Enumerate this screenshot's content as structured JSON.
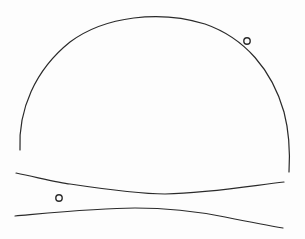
{
  "canvas": {
    "width": 305,
    "height": 239,
    "background": "#fdfdfd",
    "stroke_color": "#2a2a2a"
  },
  "drawing": {
    "dome_arc": {
      "d": "M 20 150 C 18 110, 35 70, 70 42 C 105 16, 160 10, 205 24 C 245 38, 272 70, 284 112 C 290 135, 290 155, 289 172",
      "stroke_width": 1.2
    },
    "upper_band_line": {
      "d": "M 16 173 C 40 178, 60 183, 70 184 C 110 190, 140 194, 165 194 C 210 193, 250 186, 284 182",
      "stroke_width": 1.2
    },
    "lower_band_line": {
      "d": "M 15 216 C 60 212, 100 208, 135 208 C 170 208, 200 212, 225 217 C 245 221, 265 225, 283 228",
      "stroke_width": 1.2
    },
    "small_circles": [
      {
        "name": "dome-circle",
        "cx": 247,
        "cy": 41,
        "r": 3.2
      },
      {
        "name": "band-circle",
        "cx": 59,
        "cy": 198,
        "r": 3.2
      }
    ]
  }
}
